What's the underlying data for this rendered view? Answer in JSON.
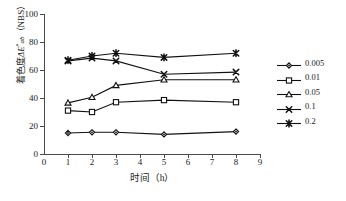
{
  "chart_data": {
    "type": "line",
    "title": "",
    "xlabel": "时间（h）",
    "ylabel": "着色度ΔE*ab（NBS）",
    "ylabel_parts": {
      "prefix": "着色度",
      "symbol": "ΔE",
      "superscript": "*",
      "subscript": "ab",
      "suffix": "（NBS）"
    },
    "x": [
      1,
      2,
      3,
      5,
      8
    ],
    "xlim": [
      0,
      9
    ],
    "ylim": [
      0,
      100
    ],
    "xticks": [
      0,
      1,
      2,
      3,
      4,
      5,
      6,
      7,
      8,
      9
    ],
    "yticks": [
      0,
      20,
      40,
      60,
      80,
      100
    ],
    "grid": false,
    "legend_position": "right",
    "series": [
      {
        "name": "0.005",
        "marker": "diamond",
        "values": [
          15,
          15.5,
          15.5,
          14,
          16
        ]
      },
      {
        "name": "0.01",
        "marker": "square",
        "values": [
          31,
          30,
          37,
          38.5,
          37
        ]
      },
      {
        "name": "0.05",
        "marker": "triangle",
        "values": [
          36.5,
          40.5,
          49,
          53,
          53
        ]
      },
      {
        "name": "0.1",
        "marker": "cross",
        "values": [
          66.5,
          68.5,
          66.5,
          57,
          58.5
        ]
      },
      {
        "name": "0.2",
        "marker": "asterisk",
        "values": [
          67,
          70,
          72,
          69,
          72
        ]
      }
    ],
    "line_color": "#111111",
    "axis_color": "#4a4a4a"
  }
}
